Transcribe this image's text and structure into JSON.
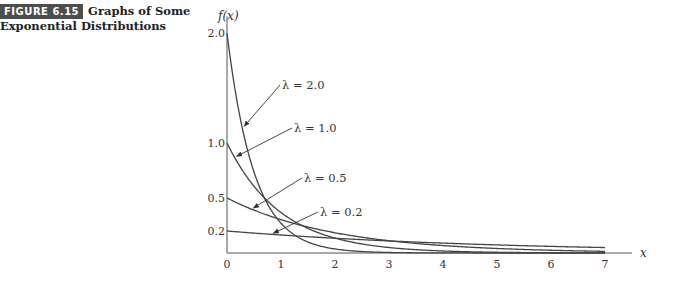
{
  "caption": {
    "badge": "FIGURE 6.15",
    "title_line1": "Graphs of Some",
    "title_line2": "Exponential Distributions"
  },
  "chart_data": {
    "type": "line",
    "title": "Graphs of Some Exponential Distributions",
    "xlabel": "x",
    "ylabel": "f(x)",
    "xlim": [
      0,
      7
    ],
    "x_ticks": [
      "0",
      "1",
      "2",
      "3",
      "4",
      "5",
      "6",
      "7"
    ],
    "y_ticks": [
      "0.2",
      "0.5",
      "1.0",
      "2.0"
    ],
    "grid": false,
    "function": "f(x) = λ e^(-λx)",
    "series": [
      {
        "name": "λ = 2.0",
        "lambda": 2.0,
        "f0": 2.0
      },
      {
        "name": "λ = 1.0",
        "lambda": 1.0,
        "f0": 1.0
      },
      {
        "name": "λ = 0.5",
        "lambda": 0.5,
        "f0": 0.5
      },
      {
        "name": "λ = 0.2",
        "lambda": 0.2,
        "f0": 0.2
      }
    ],
    "annotations": [
      {
        "text": "λ = 2.0",
        "points_to": "λ = 2.0 curve"
      },
      {
        "text": "λ = 1.0",
        "points_to": "λ = 1.0 curve"
      },
      {
        "text": "λ = 0.5",
        "points_to": "λ = 0.5 curve"
      },
      {
        "text": "λ = 0.2",
        "points_to": "λ = 0.2 curve"
      }
    ]
  }
}
